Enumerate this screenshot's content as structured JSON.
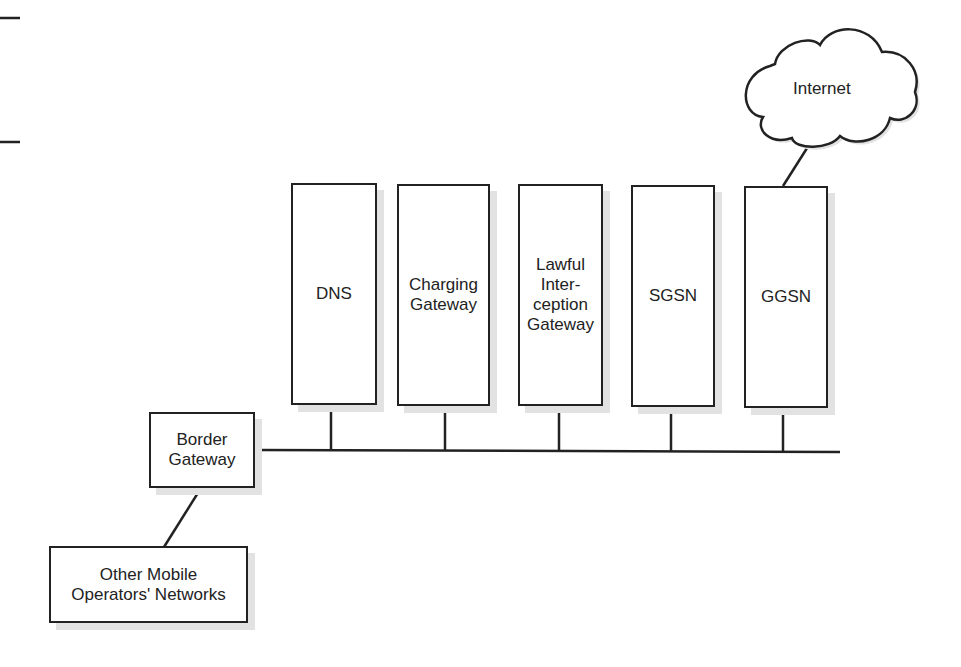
{
  "nodes": {
    "dns": {
      "label": "DNS"
    },
    "charging": {
      "label": "Charging\nGateway"
    },
    "lawful": {
      "label": "Lawful\nInter-\nception\nGateway"
    },
    "sgsn": {
      "label": "SGSN"
    },
    "ggsn": {
      "label": "GGSN"
    },
    "border": {
      "label": "Border\nGateway"
    },
    "other": {
      "label": "Other Mobile\nOperators' Networks"
    }
  },
  "cloud": {
    "label": "Internet"
  }
}
